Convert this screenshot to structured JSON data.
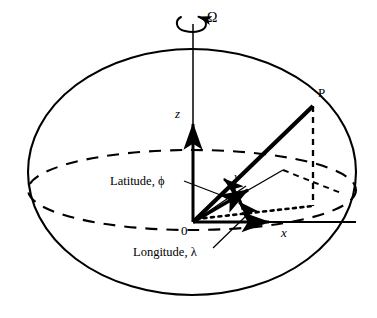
{
  "figure": {
    "background_color": "#ffffff",
    "stroke_color": "#000000",
    "labels": {
      "rotation_rate": "Ω",
      "point": "P",
      "z_axis": "z",
      "y_axis": "y",
      "x_axis": "x",
      "origin": "0",
      "latitude": "Latitude, ϕ",
      "longitude": "Longitude, λ"
    },
    "elements": {
      "sphere_outline": "solid-ellipse-outline",
      "equator": "dashed-ellipse",
      "rotation_arrow": "circular-arrow-icon",
      "polar_axis": "vertical-thin-line",
      "radius_vector": "thick-line-origin-to-P",
      "projection_drop": "dashed-vertical-P-to-equatorial-plane",
      "ground_projection": "dotted-line-origin-to-foot",
      "latitude_arc": "angle-arc-phi",
      "longitude_arc": "angle-arc-lambda"
    }
  }
}
